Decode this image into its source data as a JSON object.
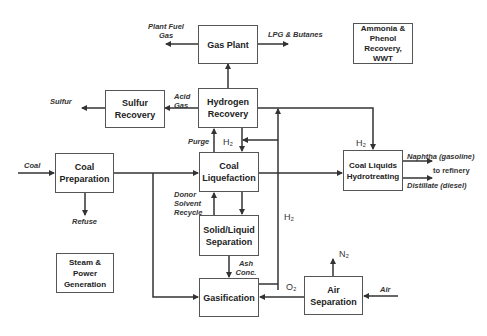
{
  "diagram": {
    "boxes": {
      "gas_plant": "Gas Plant",
      "ammonia": "Ammonia & Phenol Recovery, WWT",
      "sulfur_recovery": "Sulfur Recovery",
      "hydrogen_recovery": "Hydrogen Recovery",
      "coal_preparation": "Coal Preparation",
      "coal_liquefaction": "Coal Liquefaction",
      "coal_liquids_hydrotreating": "Coal Liquids Hydrotreating",
      "solid_liquid_separation": "Solid/Liquid Separation",
      "steam_power": "Steam & Power Generation",
      "gasification": "Gasification",
      "air_separation": "Air Separation"
    },
    "labels": {
      "plant_fuel_gas": "Plant Fuel Gas",
      "lpg_butanes": "LPG & Butanes",
      "sulfur": "Sulfur",
      "acid_gas": "Acid Gas",
      "purge": "Purge",
      "h2_top": "H₂",
      "h2_hydrotreat": "H₂",
      "h2_side": "H₂",
      "coal": "Coal",
      "refuse": "Refuse",
      "donor_solvent_recycle": "Donor Solvent Recycle",
      "naphtha": "Naphtha (gasoline)",
      "to_refinery": "to refinery",
      "distillate": "Distillate (diesel)",
      "ash_conc": "Ash Conc.",
      "o2": "O₂",
      "n2": "N₂",
      "air": "Air"
    }
  }
}
